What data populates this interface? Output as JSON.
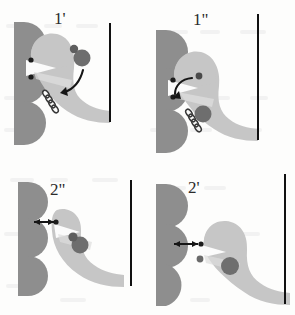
{
  "figure": {
    "background_color": "#fdfdfc",
    "panel_order": [
      "1'",
      "1\"",
      "2\"",
      "2'"
    ]
  },
  "palette": {
    "wall_gray": "#8e8e8e",
    "body_gray": "#c6c6c6",
    "body_light_gray": "#d6d6d6",
    "cleft_white": "#fbfbfb",
    "particle_dark": "#5e5e5e",
    "particle_mid": "#6e6e6e",
    "dot_black": "#1c1c1c",
    "rod_black": "#111111",
    "arrow_black": "#161616",
    "label_color": "#2b2b2b"
  },
  "panels": [
    {
      "id": "panel-1-prime",
      "label": "1'",
      "label_position": "top-center",
      "state_description": "Ligand particle free in solution, curved arrow indicates approach toward the motor head",
      "wall": {
        "name": "scalloped-wall",
        "lobes": 3,
        "color": "#8e8e8e"
      },
      "body": {
        "name": "motor-body",
        "color": "#c6c6c6"
      },
      "coil": {
        "name": "coil-glyph",
        "visible": true,
        "turns": 4
      },
      "anchor_dots": 2,
      "particle": {
        "name": "ligand-particle",
        "attached": false,
        "position": "upper-right",
        "has_satellite": true
      },
      "arrow": {
        "name": "curved-approach-arrow",
        "type": "curved",
        "heads": 1,
        "direction": "down-left"
      },
      "rod": {
        "name": "vertical-rod",
        "visible": true
      }
    },
    {
      "id": "panel-1-double-prime",
      "label": "1\"",
      "label_position": "top-center",
      "state_description": "Ligand particle docked near the head; curved arrow indicates motion up and left toward the wall",
      "wall": {
        "name": "scalloped-wall",
        "lobes": 3,
        "color": "#8e8e8e"
      },
      "body": {
        "name": "motor-body",
        "color": "#c6c6c6"
      },
      "coil": {
        "name": "coil-glyph",
        "visible": true,
        "turns": 4
      },
      "anchor_dots": 2,
      "particle": {
        "name": "ligand-particle",
        "attached": true,
        "position": "head-lower",
        "has_satellite": false
      },
      "arrow": {
        "name": "curved-binding-arrow",
        "type": "curved",
        "heads": 1,
        "direction": "up-left"
      },
      "rod": {
        "name": "vertical-rod",
        "visible": true
      }
    },
    {
      "id": "panel-2-double-prime",
      "label": "2\"",
      "label_position": "top-center",
      "state_description": "Detached state: double-headed arrow marks the gap between wall and head; particle lodged in the neck",
      "wall": {
        "name": "scalloped-wall",
        "lobes": 3,
        "color": "#8e8e8e"
      },
      "body": {
        "name": "motor-body",
        "color": "#c6c6c6"
      },
      "coil": {
        "name": "coil-glyph",
        "visible": false,
        "turns": 0
      },
      "anchor_dots": 1,
      "particle": {
        "name": "ligand-particle",
        "attached": true,
        "position": "neck-center",
        "has_satellite": true
      },
      "arrow": {
        "name": "gap-double-arrow",
        "type": "double-headed",
        "heads": 2,
        "direction": "horizontal"
      },
      "rod": {
        "name": "vertical-rod",
        "visible": true
      }
    },
    {
      "id": "panel-2-prime",
      "label": "2'",
      "label_position": "top-center",
      "state_description": "Reset state: double-headed arrow marks the gap; particle seated deeper inside the body",
      "wall": {
        "name": "scalloped-wall",
        "lobes": 3,
        "color": "#8e8e8e"
      },
      "body": {
        "name": "motor-body",
        "color": "#c6c6c6"
      },
      "coil": {
        "name": "coil-glyph",
        "visible": false,
        "turns": 0
      },
      "anchor_dots": 2,
      "particle": {
        "name": "ligand-particle",
        "attached": true,
        "position": "body-center",
        "has_satellite": false
      },
      "arrow": {
        "name": "gap-double-arrow",
        "type": "double-headed",
        "heads": 2,
        "direction": "horizontal"
      },
      "rod": {
        "name": "vertical-rod",
        "visible": true
      }
    }
  ]
}
